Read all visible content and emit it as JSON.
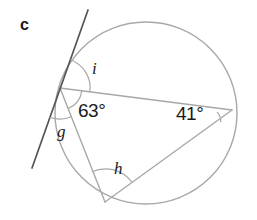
{
  "figure": {
    "part_letter": "c",
    "width": 257,
    "height": 220,
    "background_color": "#ffffff",
    "stroke_color": "#a8a8a8",
    "tangent_stroke_color": "#555555",
    "text_color": "#1a1a1a"
  },
  "circle": {
    "name": "circle-outline",
    "cx": 146,
    "cy": 113,
    "r": 91
  },
  "points": {
    "tangent_point": {
      "label": "tangent-point",
      "x": 60,
      "y": 88
    },
    "right_vertex": {
      "label": "right-vertex",
      "x": 232,
      "y": 110
    },
    "bottom_vertex": {
      "label": "bottom-vertex",
      "x": 105,
      "y": 202
    },
    "tangent_top": {
      "label": "tangent-line-top-end",
      "x": 88,
      "y": 10
    },
    "tangent_bottom": {
      "label": "tangent-line-bottom-end",
      "x": 32,
      "y": 168
    }
  },
  "lines": [
    {
      "name": "tangent-line",
      "from": "tangent_top",
      "to": "tangent_bottom"
    },
    {
      "name": "chord-tangentpoint-to-rightvertex",
      "from": "tangent_point",
      "to": "right_vertex"
    },
    {
      "name": "chord-tangentpoint-to-bottomvertex",
      "from": "tangent_point",
      "to": "bottom_vertex"
    },
    {
      "name": "chord-bottomvertex-to-rightvertex",
      "from": "bottom_vertex",
      "to": "right_vertex"
    }
  ],
  "angles": [
    {
      "id": "i",
      "name": "angle-label-i",
      "text": "i",
      "kind": "variable",
      "vertex": "tangent_point",
      "description": "tangent-chord angle above the chord",
      "label_x": 92,
      "label_y": 60
    },
    {
      "id": "sixtythree",
      "name": "angle-label-63-degrees",
      "text": "63°",
      "kind": "measure",
      "vertex": "tangent_point",
      "description": "tangent-chord angle below the chord",
      "label_x": 78,
      "label_y": 101
    },
    {
      "id": "g",
      "name": "angle-label-g",
      "text": "g",
      "kind": "variable",
      "vertex": "tangent_point",
      "description": "tangent-chord angle between tangent and lower chord",
      "label_x": 57,
      "label_y": 123
    },
    {
      "id": "h",
      "name": "angle-label-h",
      "text": "h",
      "kind": "variable",
      "vertex": "bottom_vertex",
      "description": "inscribed angle at bottom vertex",
      "label_x": 114,
      "label_y": 160
    },
    {
      "id": "fortyone",
      "name": "angle-label-41-degrees",
      "text": "41°",
      "kind": "measure",
      "vertex": "right_vertex",
      "description": "inscribed angle at right vertex",
      "label_x": 176,
      "label_y": 104
    }
  ],
  "arcs": [
    {
      "name": "arc-angle-i",
      "vertex": "tangent_point",
      "radius": 30
    },
    {
      "name": "arc-angle-63",
      "vertex": "tangent_point",
      "radius": 22
    },
    {
      "name": "arc-angle-g",
      "vertex": "tangent_point",
      "radius": 31
    },
    {
      "name": "arc-angle-h",
      "vertex": "bottom_vertex",
      "radius": 33
    },
    {
      "name": "arc-angle-41",
      "vertex": "right_vertex",
      "radius": 15
    }
  ]
}
